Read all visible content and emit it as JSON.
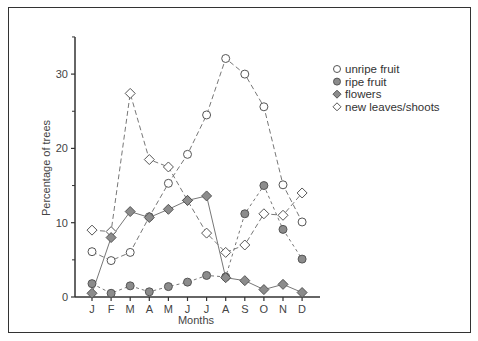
{
  "chart_data": {
    "type": "line",
    "title": "",
    "xlabel": "Months",
    "ylabel": "Percentage of trees",
    "categories": [
      "J",
      "F",
      "M",
      "A",
      "M",
      "J",
      "J",
      "A",
      "S",
      "O",
      "N",
      "D"
    ],
    "ylim": [
      0,
      35
    ],
    "yticks": [
      0,
      10,
      20,
      30
    ],
    "yminor_ticks": [
      5,
      15,
      25,
      35
    ],
    "grid": false,
    "legend_position": "upper right",
    "series": [
      {
        "name": "unripe fruit",
        "marker": "open-circle",
        "line": "dashed",
        "values": [
          6.1,
          4.9,
          6.0,
          10.8,
          15.3,
          19.2,
          24.5,
          32.1,
          30.0,
          25.6,
          15.1,
          10.1
        ]
      },
      {
        "name": "ripe fruit",
        "marker": "filled-circle",
        "line": "short-dashed",
        "values": [
          1.8,
          0.5,
          1.5,
          0.7,
          1.4,
          2.0,
          2.9,
          2.7,
          11.2,
          15.0,
          9.1,
          5.1
        ]
      },
      {
        "name": "flowers",
        "marker": "filled-diamond",
        "line": "solid",
        "values": [
          0.5,
          8.0,
          11.5,
          10.7,
          11.8,
          13.0,
          13.6,
          2.6,
          2.2,
          1.0,
          1.7,
          0.6
        ]
      },
      {
        "name": "new leaves/shoots",
        "marker": "open-diamond",
        "line": "dashed",
        "values": [
          9.0,
          8.8,
          27.4,
          18.5,
          17.5,
          13.0,
          8.6,
          6.0,
          7.0,
          11.2,
          11.0,
          14.0
        ]
      }
    ]
  },
  "colors": {
    "axis": "#333333",
    "marker_fill": "#8c8c8c",
    "marker_stroke": "#555555",
    "open_fill": "#ffffff",
    "line": "#777777"
  }
}
